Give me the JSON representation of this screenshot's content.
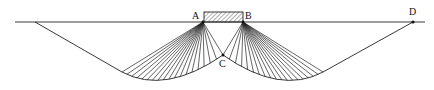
{
  "diagram": {
    "type": "bearing-capacity-failure-surface",
    "labels": {
      "A": "A",
      "B": "B",
      "C": "C",
      "D": "D"
    },
    "points": {
      "A": [
        203,
        22
      ],
      "B": [
        243,
        22
      ],
      "C": [
        223,
        55
      ],
      "D": [
        413,
        22
      ]
    },
    "ground_line": {
      "x1": 15,
      "x2": 425,
      "y": 22
    },
    "footing": {
      "x": 204,
      "y": 12,
      "width": 39,
      "height": 10,
      "hatched": true
    },
    "colors": {
      "line": "#222222",
      "background": "#ffffff"
    }
  }
}
